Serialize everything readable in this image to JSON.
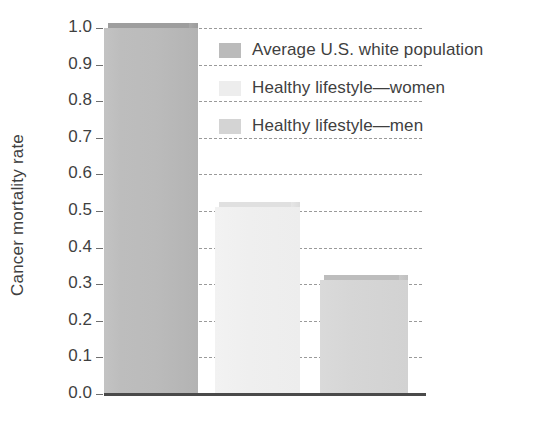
{
  "chart_data": {
    "type": "bar",
    "title": "",
    "subtitle": "",
    "xlabel": "",
    "ylabel": "Cancer mortality rate",
    "categories": [
      "Average U.S. white population",
      "Healthy lifestyle—women",
      "Healthy lifestyle—men"
    ],
    "values": [
      1.0,
      0.51,
      0.31
    ],
    "ylim": [
      0.0,
      1.0
    ],
    "ytick_labels": [
      "1.0",
      "0.9",
      "0.8",
      "0.7",
      "0.6",
      "0.5",
      "0.4",
      "0.3",
      "0.2",
      "0.1",
      "0.0"
    ],
    "ytick_values": [
      1.0,
      0.9,
      0.8,
      0.7,
      0.6,
      0.5,
      0.4,
      0.3,
      0.2,
      0.1,
      0.0
    ],
    "xtick_labels": [],
    "grid": "horizontal-dashed",
    "legend_position": "inside-top-right",
    "series": [
      {
        "name": "Average U.S. white population",
        "value": 1.0,
        "color": "#bbbbbb"
      },
      {
        "name": "Healthy lifestyle—women",
        "value": 0.51,
        "color": "#efefef"
      },
      {
        "name": "Healthy lifestyle—men",
        "value": 0.31,
        "color": "#d6d6d6"
      }
    ]
  },
  "axis": {
    "y_title": "Cancer mortality rate",
    "ticks": [
      {
        "label": "1.0",
        "value": 1.0
      },
      {
        "label": "0.9",
        "value": 0.9
      },
      {
        "label": "0.8",
        "value": 0.8
      },
      {
        "label": "0.7",
        "value": 0.7
      },
      {
        "label": "0.6",
        "value": 0.6
      },
      {
        "label": "0.5",
        "value": 0.5
      },
      {
        "label": "0.4",
        "value": 0.4
      },
      {
        "label": "0.3",
        "value": 0.3
      },
      {
        "label": "0.2",
        "value": 0.2
      },
      {
        "label": "0.1",
        "value": 0.1
      },
      {
        "label": "0.0",
        "value": 0.0
      }
    ]
  },
  "legend": {
    "items": [
      {
        "label": "Average U.S. white population",
        "swatch": "#bbbbbb"
      },
      {
        "label": "Healthy lifestyle—women",
        "swatch": "#ededed"
      },
      {
        "label": "Healthy lifestyle—men",
        "swatch": "#d4d4d4"
      }
    ]
  },
  "colors": {
    "bar_average": "#bbbbbb",
    "bar_women": "#efefef",
    "bar_men": "#d6d6d6",
    "gridline": "#9a9a9a",
    "axis": "#4a4a4a",
    "text": "#3f3f3f"
  }
}
